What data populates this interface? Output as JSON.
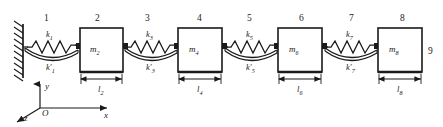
{
  "figure": {
    "type": "mechanical-schematic",
    "wall": {
      "name": "fixed-support",
      "hatching": true
    },
    "node_numbers": [
      {
        "label": "1",
        "x": 47,
        "y": 20
      },
      {
        "label": "2",
        "x": 98,
        "y": 20
      },
      {
        "label": "3",
        "x": 148,
        "y": 20
      },
      {
        "label": "4",
        "x": 200,
        "y": 20
      },
      {
        "label": "5",
        "x": 250,
        "y": 20
      },
      {
        "label": "6",
        "x": 302,
        "y": 20
      },
      {
        "label": "7",
        "x": 352,
        "y": 20
      },
      {
        "label": "8",
        "x": 402,
        "y": 20
      },
      {
        "label": "9",
        "x": 430,
        "y": 52
      }
    ],
    "masses": [
      {
        "name": "mass-2",
        "symbol": "m",
        "sub": "2",
        "x": 80,
        "y": 28,
        "w": 43,
        "h": 44,
        "length_symbol": "l",
        "length_sub": "2"
      },
      {
        "name": "mass-4",
        "symbol": "m",
        "sub": "4",
        "x": 178,
        "y": 28,
        "w": 44,
        "h": 44,
        "length_symbol": "l",
        "length_sub": "4"
      },
      {
        "name": "mass-6",
        "symbol": "m",
        "sub": "6",
        "x": 278,
        "y": 28,
        "w": 44,
        "h": 44,
        "length_symbol": "l",
        "length_sub": "6"
      },
      {
        "name": "mass-8",
        "symbol": "m",
        "sub": "8",
        "x": 378,
        "y": 28,
        "w": 44,
        "h": 44,
        "length_symbol": "l",
        "length_sub": "8"
      }
    ],
    "springs": [
      {
        "name": "spring-1",
        "upper_symbol": "k",
        "upper_sub": "1",
        "lower_symbol": "k",
        "lower_sub": "1",
        "lower_prime": "′",
        "x1": 23,
        "x2": 80,
        "cy": 50
      },
      {
        "name": "spring-3",
        "upper_symbol": "k",
        "upper_sub": "3",
        "lower_symbol": "k",
        "lower_sub": "3",
        "lower_prime": "′",
        "x1": 123,
        "x2": 178,
        "cy": 50
      },
      {
        "name": "spring-5",
        "upper_symbol": "k",
        "upper_sub": "5",
        "lower_symbol": "k",
        "lower_sub": "5",
        "lower_prime": "′",
        "x1": 222,
        "x2": 278,
        "cy": 50
      },
      {
        "name": "spring-7",
        "upper_symbol": "k",
        "upper_sub": "7",
        "lower_symbol": "k",
        "lower_sub": "7",
        "lower_prime": "′",
        "x1": 322,
        "x2": 378,
        "cy": 50
      }
    ],
    "axes": {
      "origin_label": "O",
      "x_label": "x",
      "y_label": "y",
      "z_label": "z",
      "origin": {
        "x": 40,
        "y": 108
      }
    },
    "colors": {
      "stroke": "#1a1a1a",
      "background": "#ffffff",
      "mass_fill": "#ffffff"
    }
  }
}
